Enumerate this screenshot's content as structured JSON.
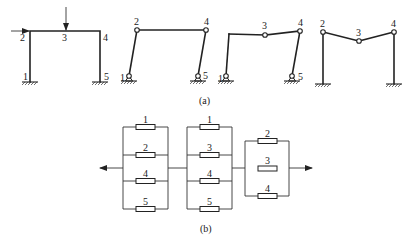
{
  "figure": {
    "part_a": {
      "caption": "(a)",
      "frames": [
        {
          "id": "rigid-frame",
          "nodes": {
            "n1": "1",
            "n2": "2",
            "n3": "3",
            "n4": "4",
            "n5": "5"
          },
          "loads": [
            "horizontal force at node 2",
            "vertical force at node 3"
          ]
        },
        {
          "id": "mechanism-sway",
          "nodes": {
            "n1": "1",
            "n2": "2",
            "n4": "4",
            "n5": "5"
          }
        },
        {
          "id": "mechanism-combined",
          "nodes": {
            "n1": "1",
            "n3": "3",
            "n4": "4",
            "n5": "5"
          }
        },
        {
          "id": "mechanism-beam",
          "nodes": {
            "n2": "2",
            "n3": "3",
            "n4": "4"
          }
        }
      ]
    },
    "part_b": {
      "caption": "(b)",
      "groups": [
        {
          "id": "group-1",
          "elements": [
            "1",
            "2",
            "4",
            "5"
          ]
        },
        {
          "id": "group-2",
          "elements": [
            "1",
            "3",
            "4",
            "5"
          ]
        },
        {
          "id": "group-3",
          "elements": [
            "2",
            "3",
            "4"
          ]
        }
      ]
    }
  }
}
